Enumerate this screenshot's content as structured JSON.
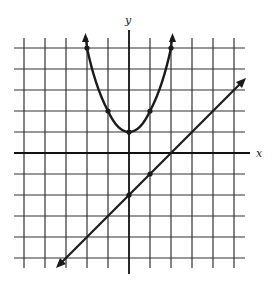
{
  "figure": {
    "x_axis_label": "x",
    "y_axis_label": "y",
    "grid": {
      "x_min": -5,
      "x_max": 5,
      "y_min": -5,
      "y_max": 5,
      "step": 1
    },
    "curves": [
      {
        "name": "parabola",
        "equation": "y = x^2 + 1",
        "marked_points": [
          [
            -2,
            5
          ],
          [
            -1,
            2
          ],
          [
            0,
            1
          ],
          [
            1,
            2
          ],
          [
            2,
            5
          ]
        ]
      },
      {
        "name": "line",
        "equation": "y = x - 2",
        "marked_points": [
          [
            0,
            -2
          ],
          [
            1,
            -1
          ]
        ]
      }
    ],
    "colors": {
      "ink": "#1a1a1a",
      "grid": "#333333",
      "background": "#ffffff"
    }
  }
}
